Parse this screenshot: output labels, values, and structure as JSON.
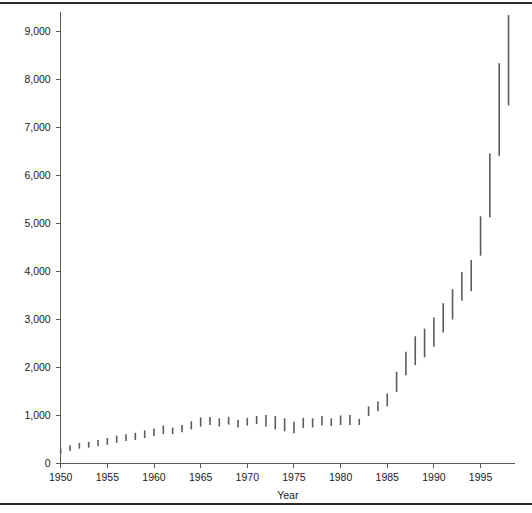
{
  "figure": {
    "background_color": "#ffffff",
    "rule_color": "#2b2b2b",
    "axis_color": "#5a5a5a",
    "bar_color": "#5b5b5b"
  },
  "axes": {
    "x_title": "Year",
    "y_title": "",
    "y_tick_labels": [
      "0",
      "1,000",
      "2,000",
      "3,000",
      "4,000",
      "5,000",
      "6,000",
      "7,000",
      "8,000",
      "9,000"
    ],
    "x_tick_labels": [
      "1950",
      "1955",
      "1960",
      "1965",
      "1970",
      "1975",
      "1980",
      "1985",
      "1990",
      "1995"
    ]
  },
  "chart_data": {
    "type": "bar",
    "title": "",
    "subtitle": "",
    "xlabel": "Year",
    "ylabel": "",
    "xlim": [
      1949.2,
      1999.0
    ],
    "ylim": [
      0,
      9400
    ],
    "grid": false,
    "legend": null,
    "x": [
      1950,
      1951,
      1952,
      1953,
      1954,
      1955,
      1956,
      1957,
      1958,
      1959,
      1960,
      1961,
      1962,
      1963,
      1964,
      1965,
      1966,
      1967,
      1968,
      1969,
      1970,
      1971,
      1972,
      1973,
      1974,
      1975,
      1976,
      1977,
      1978,
      1979,
      1980,
      1981,
      1982,
      1983,
      1984,
      1985,
      1986,
      1987,
      1988,
      1989,
      1990,
      1991,
      1992,
      1993,
      1994,
      1995,
      1996,
      1997,
      1998
    ],
    "categories": [
      1950,
      1951,
      1952,
      1953,
      1954,
      1955,
      1956,
      1957,
      1958,
      1959,
      1960,
      1961,
      1962,
      1963,
      1964,
      1965,
      1966,
      1967,
      1968,
      1969,
      1970,
      1971,
      1972,
      1973,
      1974,
      1975,
      1976,
      1977,
      1978,
      1979,
      1980,
      1981,
      1982,
      1983,
      1984,
      1985,
      1986,
      1987,
      1988,
      1989,
      1990,
      1991,
      1992,
      1993,
      1994,
      1995,
      1996,
      1997,
      1998
    ],
    "series": [
      {
        "name": "low",
        "values": [
          200,
          250,
          300,
          320,
          350,
          380,
          420,
          460,
          480,
          520,
          560,
          600,
          600,
          640,
          700,
          760,
          790,
          760,
          800,
          740,
          780,
          810,
          760,
          700,
          660,
          620,
          730,
          740,
          780,
          770,
          790,
          790,
          790,
          980,
          1080,
          1180,
          1480,
          1830,
          2040,
          2200,
          2420,
          2720,
          2990,
          3380,
          3580,
          4320,
          5120,
          6400,
          7450
        ]
      },
      {
        "name": "high",
        "values": [
          300,
          370,
          420,
          440,
          480,
          520,
          570,
          600,
          630,
          680,
          720,
          780,
          740,
          790,
          870,
          950,
          960,
          930,
          960,
          900,
          940,
          980,
          1000,
          980,
          930,
          860,
          940,
          930,
          980,
          930,
          990,
          1000,
          920,
          1180,
          1280,
          1450,
          1900,
          2320,
          2640,
          2800,
          3030,
          3330,
          3620,
          3980,
          4230,
          5140,
          6450,
          8330,
          9330
        ]
      }
    ],
    "values": [
      300,
      370,
      420,
      440,
      480,
      520,
      570,
      600,
      630,
      680,
      720,
      780,
      740,
      790,
      870,
      950,
      960,
      930,
      960,
      900,
      940,
      980,
      1000,
      980,
      930,
      860,
      940,
      930,
      980,
      930,
      990,
      1000,
      920,
      1180,
      1280,
      1450,
      1900,
      2320,
      2640,
      2800,
      3030,
      3330,
      3620,
      3980,
      4230,
      5140,
      6450,
      8330,
      9330
    ]
  },
  "geometry": {
    "plot_left": 60.7,
    "plot_right": 515.0,
    "baseline_y": 463.0,
    "px_per_1000": 48.0,
    "px_per_year": 9.33
  }
}
